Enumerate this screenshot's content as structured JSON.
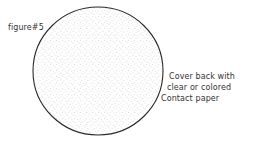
{
  "figure": {
    "label": "figure#5",
    "shape": "circle",
    "fill": "stippled dots",
    "outline_color": "#2a2a2a",
    "dot_color": "#8a8a8a"
  },
  "note": {
    "lines": [
      "Cover back with",
      "clear or colored",
      "Contact paper"
    ]
  }
}
